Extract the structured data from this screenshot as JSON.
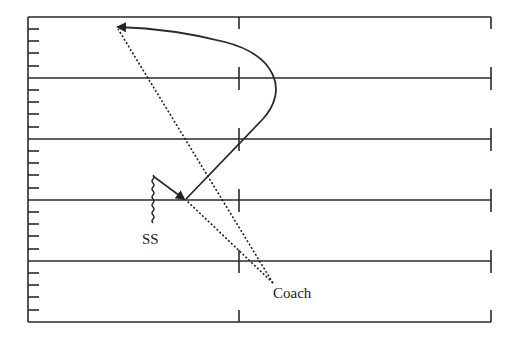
{
  "diagram": {
    "type": "football-play",
    "labels": {
      "safety": "SS",
      "coach": "Coach"
    },
    "colors": {
      "line": "#2a2a2a",
      "background": "#ffffff"
    },
    "field": {
      "left": 28,
      "right": 491,
      "top": 17,
      "bottom": 322,
      "yard_lines_y": [
        78,
        139,
        200,
        261
      ],
      "hash_x": 239
    }
  }
}
